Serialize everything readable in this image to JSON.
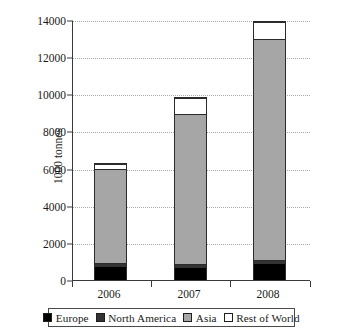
{
  "chart_data": {
    "type": "bar",
    "subtype": "stacked-bar",
    "title": "",
    "xlabel": "",
    "ylabel": "1000 tonnes",
    "categories": [
      "2006",
      "2007",
      "2008"
    ],
    "ylim": [
      0,
      14000
    ],
    "yticks": [
      0,
      2000,
      4000,
      6000,
      8000,
      10000,
      12000,
      14000
    ],
    "ytick_labels": [
      "0",
      "2000",
      "4000",
      "6000",
      "8000",
      "10000",
      "12000",
      "14000"
    ],
    "grid": true,
    "grid_axis": "y",
    "grid_style": "dotted",
    "legend_position": "bottom",
    "series": [
      {
        "name": "Europe",
        "color": "#000000",
        "values": [
          700,
          650,
          850
        ]
      },
      {
        "name": "North America",
        "color": "#333333",
        "values": [
          250,
          200,
          250
        ]
      },
      {
        "name": "Asia",
        "color": "#a6a6a6",
        "values": [
          5100,
          8150,
          11950
        ]
      },
      {
        "name": "Rest of World",
        "color": "#ffffff",
        "values": [
          250,
          850,
          900
        ]
      }
    ],
    "totals": [
      6300,
      9850,
      13950
    ]
  },
  "legend": {
    "items": [
      {
        "label": "Europe",
        "color": "#000000"
      },
      {
        "label": "North America",
        "color": "#333333"
      },
      {
        "label": "Asia",
        "color": "#a6a6a6"
      },
      {
        "label": "Rest of World",
        "color": "#ffffff"
      }
    ]
  }
}
